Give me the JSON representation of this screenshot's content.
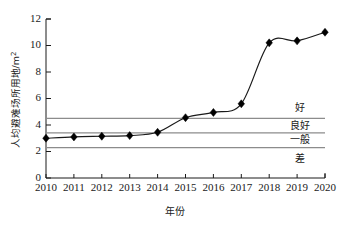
{
  "chart_data": {
    "type": "line",
    "title": "",
    "xlabel": "年份",
    "ylabel": "人均避难场所用地/m²",
    "ylabel_main": "人均避难场所用地/m",
    "ylabel_sup": "2",
    "x": [
      2010,
      2011,
      2012,
      2013,
      2014,
      2015,
      2016,
      2017,
      2018,
      2019,
      2020
    ],
    "categories": [
      "2010",
      "2011",
      "2012",
      "2013",
      "2014",
      "2015",
      "2016",
      "2017",
      "2018",
      "2019",
      "2020"
    ],
    "values": [
      3.0,
      3.1,
      3.15,
      3.2,
      3.45,
      4.55,
      4.95,
      5.6,
      10.2,
      10.35,
      11.0
    ],
    "series": [
      {
        "name": "人均避难场所用地",
        "values": [
          3.0,
          3.1,
          3.15,
          3.2,
          3.45,
          4.55,
          4.95,
          5.6,
          10.2,
          10.35,
          11.0
        ]
      }
    ],
    "ylim": [
      0,
      12
    ],
    "yticks": [
      0,
      2,
      4,
      6,
      8,
      10,
      12
    ],
    "ytick_labels": [
      "0",
      "2",
      "4",
      "6",
      "8",
      "10",
      "12"
    ],
    "xlim": [
      2010,
      2020
    ],
    "xticks": [
      2010,
      2011,
      2012,
      2013,
      2014,
      2015,
      2016,
      2017,
      2018,
      2019,
      2020
    ],
    "grid": false,
    "legend": "none",
    "marker": "diamond",
    "line_color": "#1a1a1a",
    "marker_color": "#000000",
    "threshold_color": "#8c8c8c",
    "thresholds": [
      {
        "label": "好",
        "value": 4.5,
        "zone_center": 5.3
      },
      {
        "label": "良好",
        "value": 3.4,
        "zone_center": 3.95
      },
      {
        "label": "一般",
        "value": 2.3,
        "zone_center": 2.85
      },
      {
        "label": "差",
        "value": null,
        "zone_center": 1.4
      }
    ],
    "zone_labels": [
      "好",
      "良好",
      "一般",
      "差"
    ]
  }
}
